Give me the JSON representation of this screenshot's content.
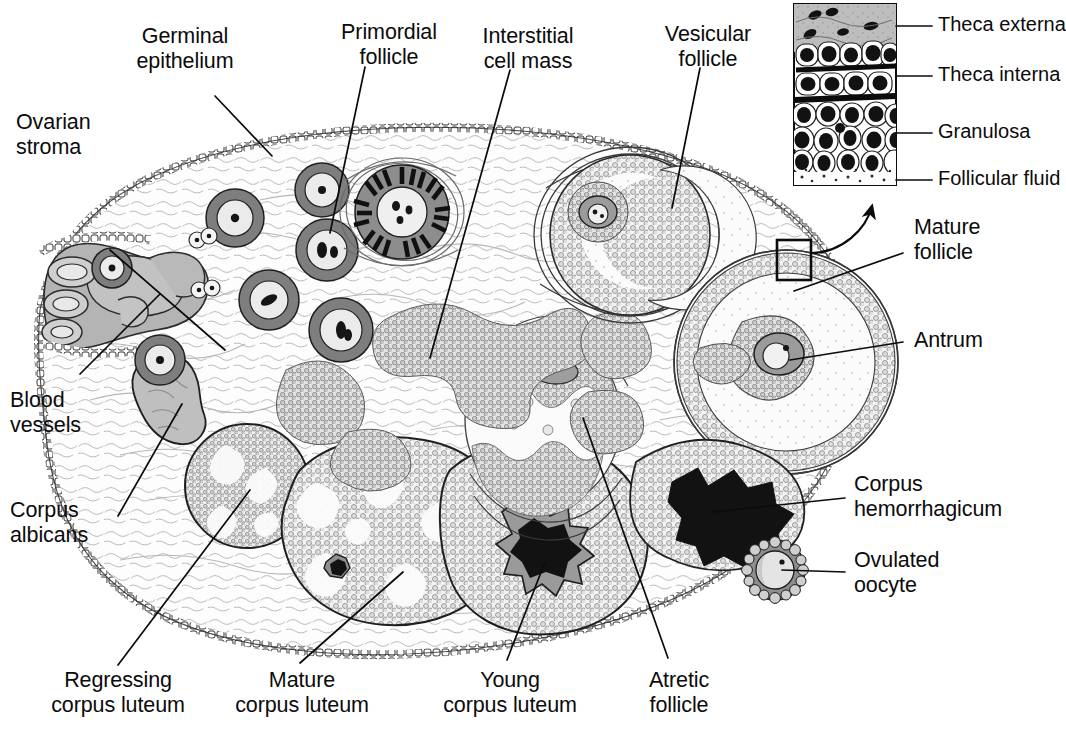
{
  "figure": {
    "kind": "histology-diagram",
    "style": "black-and-white line drawing with stipple and gray tone"
  },
  "labels": {
    "germinal_epithelium": "Germinal\nepithelium",
    "ovarian_stroma": "Ovarian\nstroma",
    "primordial_follicle": "Primordial\nfollicle",
    "interstitial_cell_mass": "Interstitial\ncell mass",
    "vesicular_follicle": "Vesicular\nfollicle",
    "mature_follicle": "Mature\nfollicle",
    "antrum": "Antrum",
    "blood_vessels": "Blood\nvessels",
    "corpus_albicans": "Corpus\nalbicans",
    "corpus_hemorrhagicum": "Corpus\nhemorrhagicum",
    "ovulated_oocyte": "Ovulated\noocyte",
    "regressing_corpus_luteum": "Regressing\ncorpus luteum",
    "mature_corpus_luteum": "Mature\ncorpus luteum",
    "young_corpus_luteum": "Young\ncorpus luteum",
    "atretic_follicle": "Atretic\nfollicle"
  },
  "inset": {
    "title": "follicle wall detail",
    "layers": [
      {
        "name": "Theca externa",
        "tone": "gray, spindle nuclei"
      },
      {
        "name": "Theca interna",
        "tone": "epithelioid cells, dark bands"
      },
      {
        "name": "Granulosa",
        "tone": "white cells, dark nuclei"
      },
      {
        "name": "Follicular fluid",
        "tone": "stippled clear space"
      }
    ]
  },
  "colors": {
    "ink": "#0b0b0b",
    "stroma_fill": "#fdfdfd",
    "stipple_gray": "#b9b9b9",
    "tone_gray": "#b0b0b0",
    "tone_gray_dark": "#8e8e8e",
    "clot_black": "#111111",
    "background": "#ffffff"
  }
}
